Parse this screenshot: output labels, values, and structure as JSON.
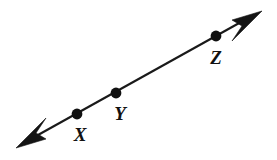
{
  "figure": {
    "type": "geometry-line-diagram",
    "background_color": "#ffffff",
    "stroke_color": "#1a1a1a",
    "label_color": "#111111",
    "canvas": {
      "width": 277,
      "height": 160
    },
    "line": {
      "start": {
        "x": 16,
        "y": 148
      },
      "end": {
        "x": 262,
        "y": 11
      },
      "stroke_width": 2.1,
      "double_headed": true
    },
    "arrowheads": [
      {
        "name": "lower-left-arrowhead",
        "tip": {
          "x": 16,
          "y": 148
        },
        "direction": "down-left"
      },
      {
        "name": "upper-right-arrowhead",
        "tip": {
          "x": 262,
          "y": 11
        },
        "direction": "up-right"
      }
    ],
    "points": [
      {
        "label": "X",
        "dot": {
          "x": 77,
          "y": 114,
          "r": 5.4
        },
        "label_pos": {
          "x": 80,
          "y": 141
        }
      },
      {
        "label": "Y",
        "dot": {
          "x": 116,
          "y": 93,
          "r": 5.4
        },
        "label_pos": {
          "x": 120,
          "y": 120
        }
      },
      {
        "label": "Z",
        "dot": {
          "x": 216,
          "y": 36,
          "r": 5.4
        },
        "label_pos": {
          "x": 216,
          "y": 64
        }
      }
    ]
  }
}
